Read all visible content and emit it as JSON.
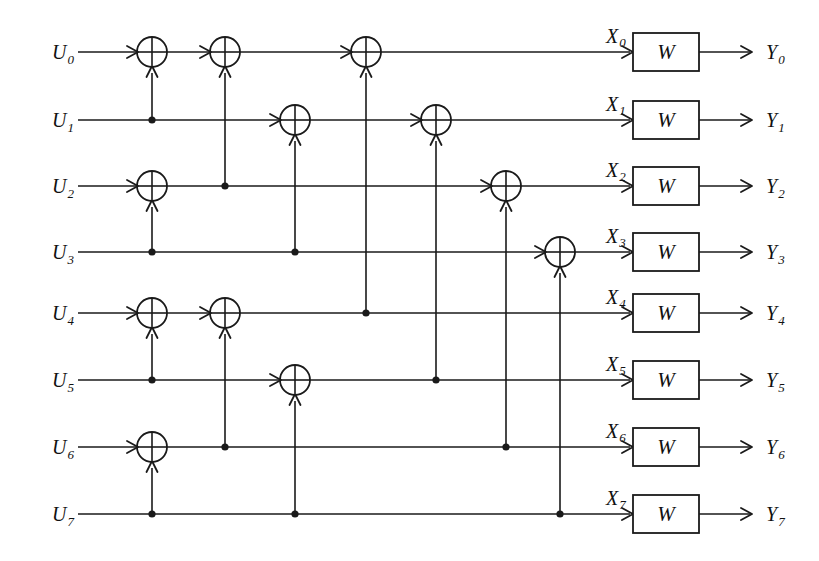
{
  "figure": {
    "type": "polar-code-encoder-circuit",
    "code_length": 8,
    "stages": 3,
    "channel_block_label": "W",
    "input_labels": [
      "U",
      "U",
      "U",
      "U",
      "U",
      "U",
      "U",
      "U"
    ],
    "input_subscripts": [
      "0",
      "1",
      "2",
      "3",
      "4",
      "5",
      "6",
      "7"
    ],
    "coded_labels": [
      "X",
      "X",
      "X",
      "X",
      "X",
      "X",
      "X",
      "X"
    ],
    "coded_subscripts": [
      "0",
      "1",
      "2",
      "3",
      "4",
      "5",
      "6",
      "7"
    ],
    "output_labels": [
      "Y",
      "Y",
      "Y",
      "Y",
      "Y",
      "Y",
      "Y",
      "Y"
    ],
    "output_subscripts": [
      "0",
      "1",
      "2",
      "3",
      "4",
      "5",
      "6",
      "7"
    ],
    "colors": {
      "ink": "#1a1a1a",
      "background": "#ffffff",
      "text": "#111111"
    },
    "geometry": {
      "width": 819,
      "height": 561,
      "row_y": [
        52,
        120,
        186,
        252,
        313,
        380,
        447,
        514
      ],
      "column_x": [
        152,
        225,
        295,
        366,
        436,
        506,
        560
      ],
      "wire_start_x": 78,
      "wire_end_x": 630,
      "xor_radius": 15,
      "dot_radius": 3.6,
      "w_block_x": 633,
      "w_block_width": 66,
      "w_block_height": 38,
      "w_out_end_x": 752,
      "u_label_x": 52,
      "x_label_x": 606,
      "y_label_x": 766
    },
    "xor_gates": [
      {
        "col": 0,
        "row": 0,
        "source_row": 1
      },
      {
        "col": 0,
        "row": 2,
        "source_row": 3
      },
      {
        "col": 0,
        "row": 4,
        "source_row": 5
      },
      {
        "col": 0,
        "row": 6,
        "source_row": 7
      },
      {
        "col": 1,
        "row": 0,
        "source_row": 2
      },
      {
        "col": 1,
        "row": 4,
        "source_row": 6
      },
      {
        "col": 2,
        "row": 1,
        "source_row": 3
      },
      {
        "col": 2,
        "row": 5,
        "source_row": 7
      },
      {
        "col": 3,
        "row": 0,
        "source_row": 4
      },
      {
        "col": 4,
        "row": 1,
        "source_row": 5
      },
      {
        "col": 5,
        "row": 2,
        "source_row": 6
      },
      {
        "col": 6,
        "row": 3,
        "source_row": 7
      }
    ],
    "tap_dots": [
      {
        "col": 0,
        "row": 1
      },
      {
        "col": 0,
        "row": 3
      },
      {
        "col": 0,
        "row": 5
      },
      {
        "col": 0,
        "row": 7
      },
      {
        "col": 1,
        "row": 2
      },
      {
        "col": 1,
        "row": 6
      },
      {
        "col": 2,
        "row": 3
      },
      {
        "col": 2,
        "row": 7
      },
      {
        "col": 3,
        "row": 4
      },
      {
        "col": 4,
        "row": 5
      },
      {
        "col": 5,
        "row": 6
      },
      {
        "col": 6,
        "row": 7
      }
    ]
  }
}
